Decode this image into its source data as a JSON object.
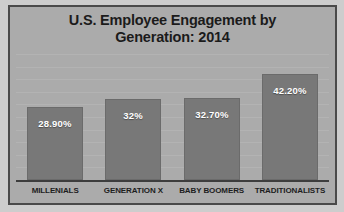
{
  "chart_data": {
    "type": "bar",
    "title": "U.S. Employee Engagement by Generation: 2014",
    "title_line1": "U.S. Employee Engagement by",
    "title_line2": "Generation: 2014",
    "xlabel": "",
    "ylabel": "",
    "ylim": [
      0,
      50
    ],
    "grid": true,
    "legend": "none",
    "categories": [
      "MILLENIALS",
      "GENERATION X",
      "BABY BOOMERS",
      "TRADITIONALISTS"
    ],
    "values": [
      28.9,
      32,
      32.7,
      42.2
    ],
    "data_labels": [
      "28.90%",
      "32%",
      "32.70%",
      "42.20%"
    ],
    "series": [
      {
        "name": "Engagement",
        "values": [
          28.9,
          32,
          32.7,
          42.2
        ]
      }
    ],
    "colors": {
      "bar": "#787878",
      "plot_background": "#ababab",
      "frame_border": "#4a4a4a",
      "outer_background": "#cdcdcd",
      "title_text": "#1b1b1b",
      "label_text": "#ffffff",
      "axis": "#3d3d3d",
      "gridline": "#b9b9b9"
    }
  }
}
